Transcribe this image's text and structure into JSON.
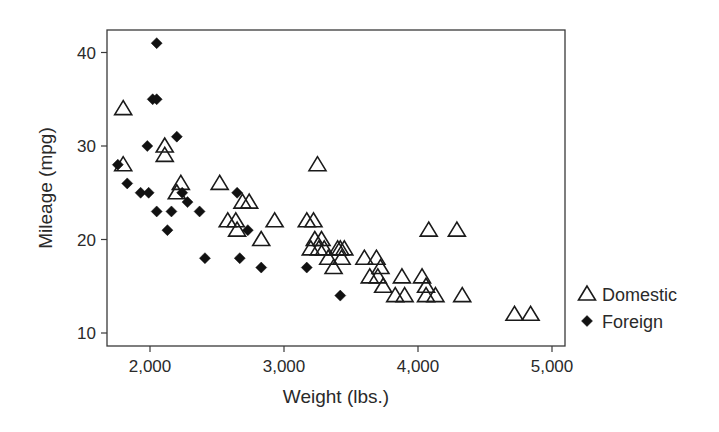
{
  "chart_data": {
    "type": "scatter",
    "title": "",
    "xlabel": "Weight (lbs.)",
    "ylabel": "Mileage (mpg)",
    "xlim": [
      1680,
      5100
    ],
    "ylim": [
      8.6,
      42.3
    ],
    "x_ticks": [
      2000,
      3000,
      4000,
      5000
    ],
    "x_tick_labels": [
      "2,000",
      "3,000",
      "4,000",
      "5,000"
    ],
    "y_ticks": [
      10,
      20,
      30,
      40
    ],
    "y_tick_labels": [
      "10",
      "20",
      "30",
      "40"
    ],
    "grid": false,
    "legend_position": "right",
    "series": [
      {
        "name": "Domestic",
        "marker": "hollow-triangle",
        "color": "#1a1a1a",
        "points": [
          [
            1800,
            34
          ],
          [
            1800,
            28
          ],
          [
            2110,
            30
          ],
          [
            2110,
            29
          ],
          [
            2230,
            26
          ],
          [
            2200,
            25
          ],
          [
            2520,
            26
          ],
          [
            2690,
            24
          ],
          [
            2740,
            24
          ],
          [
            2580,
            22
          ],
          [
            2640,
            22
          ],
          [
            2650,
            21
          ],
          [
            2830,
            20
          ],
          [
            2930,
            22
          ],
          [
            3170,
            22
          ],
          [
            3220,
            22
          ],
          [
            3250,
            28
          ],
          [
            3200,
            19
          ],
          [
            3230,
            20
          ],
          [
            3260,
            19
          ],
          [
            3280,
            20
          ],
          [
            3300,
            19
          ],
          [
            3330,
            18
          ],
          [
            3370,
            17
          ],
          [
            3400,
            19
          ],
          [
            3420,
            19
          ],
          [
            3430,
            18
          ],
          [
            3450,
            19
          ],
          [
            3600,
            18
          ],
          [
            3640,
            16
          ],
          [
            3690,
            18
          ],
          [
            3700,
            16
          ],
          [
            3720,
            17
          ],
          [
            3740,
            15
          ],
          [
            3830,
            14
          ],
          [
            3880,
            16
          ],
          [
            3900,
            14
          ],
          [
            4030,
            16
          ],
          [
            4060,
            15
          ],
          [
            4060,
            14
          ],
          [
            4080,
            21
          ],
          [
            4130,
            14
          ],
          [
            4290,
            21
          ],
          [
            4330,
            14
          ],
          [
            4720,
            12
          ],
          [
            4840,
            12
          ]
        ]
      },
      {
        "name": "Foreign",
        "marker": "filled-diamond",
        "color": "#1a1a1a",
        "points": [
          [
            2050,
            41
          ],
          [
            2020,
            35
          ],
          [
            2050,
            35
          ],
          [
            2200,
            31
          ],
          [
            1980,
            30
          ],
          [
            1760,
            28
          ],
          [
            1830,
            26
          ],
          [
            1930,
            25
          ],
          [
            1990,
            25
          ],
          [
            2240,
            25
          ],
          [
            2050,
            23
          ],
          [
            2160,
            23
          ],
          [
            2280,
            24
          ],
          [
            2370,
            23
          ],
          [
            2130,
            21
          ],
          [
            2410,
            18
          ],
          [
            2670,
            18
          ],
          [
            2730,
            21
          ],
          [
            2650,
            25
          ],
          [
            2830,
            17
          ],
          [
            3170,
            17
          ],
          [
            3420,
            14
          ]
        ]
      }
    ]
  }
}
